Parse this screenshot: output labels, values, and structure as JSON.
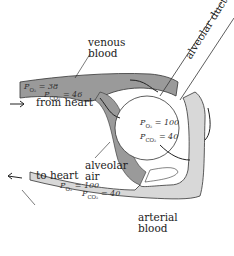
{
  "labels": {
    "venous_blood": [
      "venous",
      "blood"
    ],
    "alveolar_duct": "alveolar duct",
    "from_heart": "from heart",
    "to_heart": "to heart",
    "alveolar_air": [
      "alveolar",
      "air"
    ],
    "arterial_blood": [
      "arterial",
      "blood"
    ]
  },
  "venous": {
    "po2": "P",
    "po2_sub": "O₂",
    "po2_val": "= 38",
    "pco2": "P",
    "pco2_sub": "CO₂",
    "pco2_val": "= 46"
  },
  "alveolus": {
    "po2_val": "= 100",
    "pco2_val": "= 40"
  },
  "arterial": {
    "po2_val": "= 100",
    "pco2_val": "= 40"
  },
  "colors": {
    "venous": "#9a9a9a",
    "arterial": "#d8d8d8",
    "outline": "#333333"
  }
}
